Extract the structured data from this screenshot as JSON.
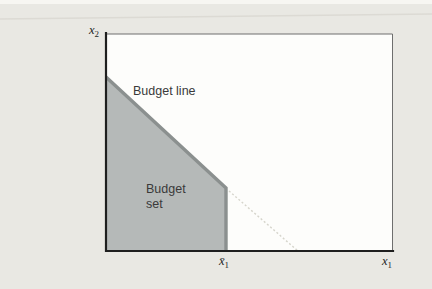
{
  "figure": {
    "labels": {
      "budget_line": "Budget line",
      "budget_set": "Budget set"
    },
    "axes": {
      "y_label": {
        "base": "x",
        "sub": "2"
      },
      "x_label": {
        "base": "x",
        "sub": "1"
      },
      "x_bar_label": {
        "base": "x̄",
        "sub": "1"
      }
    },
    "geometry": {
      "plot_area_points": "106,34 393,34 393,251 106,251",
      "budget_set_points": "107,78 225,187 225,250 107,250",
      "budget_line_points": "106,77 226,188 226,251",
      "dotted_extension_points": "229,191 298,251",
      "axes_path": "M106,33 L106,251 L393,251",
      "border_path": "M106.5,34 L392.5,34 L392.5,251",
      "scan_line_points": "0,19 432,14"
    }
  },
  "colors": {
    "page-bg": "#e9e8e3",
    "top-strip": "#f7f6f2",
    "plot-bg": "#fdfdfb",
    "budget-fill": "#b5b9b8",
    "budget-line": "#8b908f",
    "dotted-line": "#d6d5cc",
    "axis": "#1f1f1f",
    "border": "#6e6e6e",
    "text": "#3a3a3a",
    "scan-line": "#dcdad4"
  }
}
